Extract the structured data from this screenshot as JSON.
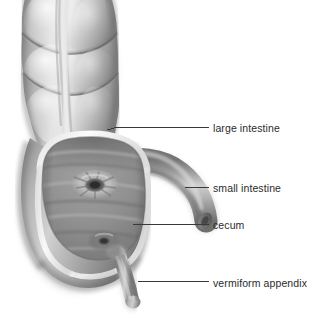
{
  "figure": {
    "background_color": "#ffffff",
    "width": 314,
    "height": 320
  },
  "style": {
    "label_color": "#2b2b2b",
    "leader_line_color": "#3a3a3a",
    "tissue_light": "#d8d8d8",
    "tissue_mid": "#a9a9a9",
    "tissue_dark": "#6e6e6e",
    "lumen_dark": "#4a4a4a",
    "cut_edge": "#f2f2f2"
  },
  "annotations": [
    {
      "id": "large-intestine",
      "label": "large intestine",
      "leader": {
        "x1": 107,
        "y1": 130,
        "x2": 118,
        "y2": 127,
        "x3": 209,
        "y3": 127
      }
    },
    {
      "id": "small-intestine",
      "label": "small intestine",
      "leader": {
        "x1": 185,
        "y1": 187,
        "x2": 185,
        "y2": 187,
        "x3": 209,
        "y3": 187
      }
    },
    {
      "id": "cecum",
      "label": "cecum",
      "leader": {
        "x1": 133,
        "y1": 224,
        "x2": 150,
        "y2": 224,
        "x3": 209,
        "y3": 224
      }
    },
    {
      "id": "vermiform-appendix",
      "label": "vermiform appendix",
      "leader": {
        "x1": 138,
        "y1": 281,
        "x2": 160,
        "y2": 281,
        "x3": 209,
        "y3": 281
      }
    }
  ],
  "structures": {
    "ascending_colon": "haustra segments of ascending colon with taenia coli band",
    "taenia_coli": "pale longitudinal muscle band",
    "cecum_wall": "cut-away cecum wall showing cut edge rim",
    "cecum_lumen": "interior mucosal surface of cecum",
    "ileocecal_orifice": "ileocecal valve opening",
    "appendiceal_orifice": "opening of vermiform appendix",
    "ileum": "terminal ileum entering cecum",
    "appendix": "vermiform appendix"
  }
}
